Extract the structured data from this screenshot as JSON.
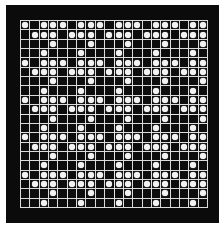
{
  "game": {
    "type": "grid-board",
    "rows": 20,
    "cols": 20,
    "colors": {
      "background": "#ffffff",
      "frame": "#0b0b0b",
      "cell": "#0d0d0d",
      "grid_line": "#dcdcdc",
      "stone": "#f2f2f2"
    },
    "pattern_tile": [
      [
        1,
        0,
        1,
        1
      ],
      [
        0,
        1,
        1,
        1
      ],
      [
        0,
        0,
        0,
        1
      ],
      [
        0,
        0,
        1,
        0
      ]
    ],
    "board": [
      [
        1,
        0,
        1,
        1,
        1,
        0,
        1,
        1,
        1,
        0,
        1,
        1,
        1,
        0,
        1,
        1,
        1,
        0,
        1,
        1
      ],
      [
        0,
        1,
        1,
        1,
        0,
        1,
        1,
        1,
        0,
        1,
        1,
        1,
        0,
        1,
        1,
        1,
        0,
        1,
        1,
        1
      ],
      [
        0,
        0,
        0,
        1,
        0,
        0,
        0,
        1,
        0,
        0,
        0,
        1,
        0,
        0,
        0,
        1,
        0,
        0,
        0,
        1
      ],
      [
        0,
        0,
        1,
        0,
        0,
        0,
        1,
        0,
        0,
        0,
        1,
        0,
        0,
        0,
        1,
        0,
        0,
        0,
        1,
        0
      ],
      [
        1,
        0,
        1,
        1,
        1,
        0,
        1,
        1,
        1,
        0,
        1,
        1,
        1,
        0,
        1,
        1,
        1,
        0,
        1,
        1
      ],
      [
        0,
        1,
        1,
        1,
        0,
        1,
        1,
        1,
        0,
        1,
        1,
        1,
        0,
        1,
        1,
        1,
        0,
        1,
        1,
        1
      ],
      [
        0,
        0,
        0,
        1,
        0,
        0,
        0,
        1,
        0,
        0,
        0,
        1,
        0,
        0,
        0,
        1,
        0,
        0,
        0,
        1
      ],
      [
        0,
        0,
        1,
        0,
        0,
        0,
        1,
        0,
        0,
        0,
        1,
        0,
        0,
        0,
        1,
        0,
        0,
        0,
        1,
        0
      ],
      [
        1,
        0,
        1,
        1,
        1,
        0,
        1,
        1,
        1,
        0,
        1,
        1,
        1,
        0,
        1,
        1,
        1,
        0,
        1,
        1
      ],
      [
        0,
        1,
        1,
        1,
        0,
        1,
        1,
        1,
        0,
        1,
        1,
        1,
        0,
        1,
        1,
        1,
        0,
        1,
        1,
        1
      ],
      [
        0,
        0,
        0,
        1,
        0,
        0,
        0,
        1,
        0,
        0,
        0,
        1,
        0,
        0,
        0,
        1,
        0,
        0,
        0,
        1
      ],
      [
        0,
        0,
        1,
        0,
        0,
        0,
        1,
        0,
        0,
        0,
        1,
        0,
        0,
        0,
        1,
        0,
        0,
        0,
        1,
        0
      ],
      [
        1,
        0,
        1,
        1,
        1,
        0,
        1,
        1,
        1,
        0,
        1,
        1,
        1,
        0,
        1,
        1,
        1,
        0,
        1,
        1
      ],
      [
        0,
        1,
        1,
        1,
        0,
        1,
        1,
        1,
        0,
        1,
        1,
        1,
        0,
        1,
        1,
        1,
        0,
        1,
        1,
        1
      ],
      [
        0,
        0,
        0,
        1,
        0,
        0,
        0,
        1,
        0,
        0,
        0,
        1,
        0,
        0,
        0,
        1,
        0,
        0,
        0,
        1
      ],
      [
        0,
        0,
        1,
        0,
        0,
        0,
        1,
        0,
        0,
        0,
        1,
        0,
        0,
        0,
        1,
        0,
        0,
        0,
        1,
        0
      ],
      [
        1,
        0,
        1,
        1,
        1,
        0,
        1,
        1,
        1,
        0,
        1,
        1,
        1,
        0,
        1,
        1,
        1,
        0,
        1,
        1
      ],
      [
        0,
        1,
        1,
        1,
        0,
        1,
        1,
        1,
        0,
        1,
        1,
        1,
        0,
        1,
        1,
        1,
        0,
        1,
        1,
        1
      ],
      [
        0,
        0,
        0,
        1,
        0,
        0,
        0,
        1,
        0,
        0,
        0,
        1,
        0,
        0,
        0,
        1,
        0,
        0,
        0,
        1
      ],
      [
        0,
        0,
        1,
        0,
        0,
        0,
        1,
        0,
        0,
        0,
        1,
        0,
        0,
        0,
        1,
        0,
        0,
        0,
        1,
        0
      ]
    ]
  }
}
